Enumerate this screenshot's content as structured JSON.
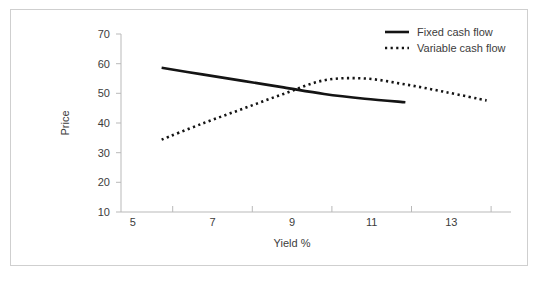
{
  "chart_data": {
    "type": "line",
    "title": "",
    "xlabel": "Yield %",
    "ylabel": "Price",
    "xlim": [
      4,
      13.6
    ],
    "ylim": [
      10,
      70
    ],
    "xticks": [
      5,
      7,
      9,
      11,
      13
    ],
    "xtick_labels": [
      "5",
      "7",
      "9",
      "11",
      "13"
    ],
    "xminor_ticks": [
      6,
      8,
      10,
      12
    ],
    "yticks": [
      10,
      20,
      30,
      40,
      50,
      60,
      70
    ],
    "ytick_labels": [
      "10",
      "20",
      "30",
      "40",
      "50",
      "60",
      "70"
    ],
    "grid": false,
    "legend_position": "top-right",
    "series": [
      {
        "name": "Fixed cash flow",
        "style": "solid",
        "color": "#141414",
        "x": [
          5,
          6,
          7,
          8,
          9,
          10,
          11
        ],
        "values": [
          58.6,
          56.4,
          54.2,
          52.0,
          49.8,
          48.2,
          47.0
        ]
      },
      {
        "name": "Variable cash flow",
        "style": "dotted",
        "color": "#141414",
        "x": [
          5,
          6,
          7,
          8,
          9,
          10,
          11,
          12,
          13
        ],
        "values": [
          34.4,
          39.8,
          44.8,
          49.8,
          54.4,
          55.0,
          53.0,
          50.4,
          47.6
        ]
      }
    ]
  },
  "legend": {
    "items": [
      {
        "label": "Fixed cash flow",
        "style": "solid"
      },
      {
        "label": "Variable cash flow",
        "style": "dotted"
      }
    ]
  },
  "axes": {
    "x_title": "Yield %",
    "y_title": "Price"
  }
}
